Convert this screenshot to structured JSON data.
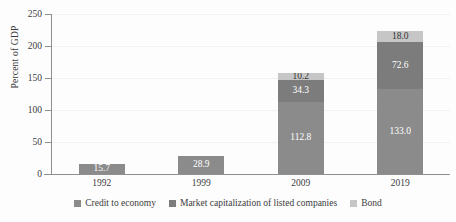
{
  "chart_data": {
    "type": "bar",
    "stacked": true,
    "title": "",
    "xlabel": "",
    "ylabel": "Percent of GDP",
    "categories": [
      "1992",
      "1999",
      "2009",
      "2019"
    ],
    "ylim": [
      0,
      250
    ],
    "yticks": [
      "0",
      "50",
      "100",
      "150",
      "200",
      "250"
    ],
    "ytick_values": [
      0,
      50,
      100,
      150,
      200,
      250
    ],
    "grid": true,
    "legend_position": "bottom",
    "series": [
      {
        "name": "Credit to economy",
        "color": "#8b8b8b",
        "label_color": "#ffffff",
        "values": [
          15.7,
          28.9,
          112.8,
          133.0
        ],
        "labels": [
          "15.7",
          "28.9",
          "112.8",
          "133.0"
        ]
      },
      {
        "name": "Market capitalization of listed companies",
        "color": "#7c7c7c",
        "label_color": "#ffffff",
        "values": [
          0,
          0,
          34.3,
          72.6
        ],
        "labels": [
          "",
          "",
          "34.3",
          "72.6"
        ]
      },
      {
        "name": "Bond",
        "color": "#c6c6c6",
        "label_color": "#343434",
        "values": [
          0,
          0,
          10.2,
          18.0
        ],
        "labels": [
          "",
          "",
          "10.2",
          "18.0"
        ]
      }
    ]
  },
  "axis": {
    "y_title": "Percent of GDP"
  },
  "legend": {
    "items": [
      {
        "label": "Credit to economy",
        "color": "#8b8b8b"
      },
      {
        "label": "Market capitalization of listed companies",
        "color": "#7c7c7c"
      },
      {
        "label": "Bond",
        "color": "#c6c6c6"
      }
    ]
  }
}
